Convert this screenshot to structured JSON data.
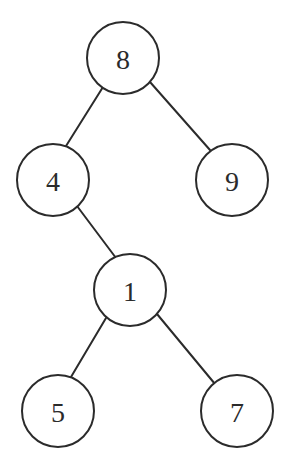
{
  "diagram": {
    "type": "binary-tree",
    "colors": {
      "stroke": "#2b2b2b",
      "node_fill": "#ffffff",
      "background": "#ffffff",
      "text": "#2b2b2b"
    },
    "node_radius": 36,
    "nodes": [
      {
        "id": "n8",
        "label": "8",
        "cx": 123,
        "cy": 58
      },
      {
        "id": "n4",
        "label": "4",
        "cx": 53,
        "cy": 180
      },
      {
        "id": "n9",
        "label": "9",
        "cx": 232,
        "cy": 180
      },
      {
        "id": "n1",
        "label": "1",
        "cx": 130,
        "cy": 290
      },
      {
        "id": "n5",
        "label": "5",
        "cx": 58,
        "cy": 411
      },
      {
        "id": "n7",
        "label": "7",
        "cx": 237,
        "cy": 411
      }
    ],
    "edges": [
      {
        "from": "n8",
        "to": "n4",
        "x1": 103,
        "y1": 87,
        "x2": 66,
        "y2": 146
      },
      {
        "from": "n8",
        "to": "n9",
        "x1": 150,
        "y1": 82,
        "x2": 210,
        "y2": 150
      },
      {
        "from": "n4",
        "to": "n1",
        "x1": 77,
        "y1": 206,
        "x2": 116,
        "y2": 258
      },
      {
        "from": "n1",
        "to": "n5",
        "x1": 106,
        "y1": 318,
        "x2": 71,
        "y2": 377
      },
      {
        "from": "n1",
        "to": "n7",
        "x1": 157,
        "y1": 314,
        "x2": 215,
        "y2": 384
      }
    ]
  }
}
